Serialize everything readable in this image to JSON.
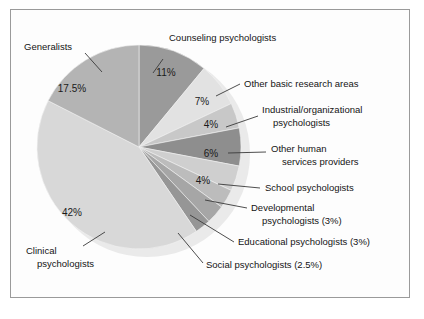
{
  "figure": {
    "border_color": "#9a9a9a",
    "background": "#fdfdfd"
  },
  "chart_data": {
    "type": "pie",
    "title": "",
    "subtitle": "",
    "xlabel": "",
    "ylabel": "",
    "legend_position": "none",
    "grid": false,
    "labels_inside": "percent",
    "start_angle_deg": 0,
    "direction": "clockwise",
    "categories": [
      "Counseling psychologists",
      "Other basic research areas",
      "Industrial/organizational psychologists",
      "Other human services providers",
      "School psychologists",
      "Developmental psychologists",
      "Educational psychologists",
      "Social psychologists",
      "Clinical psychologists",
      "Generalists"
    ],
    "values": [
      11,
      7,
      4,
      6,
      4,
      3,
      3,
      2.5,
      42,
      17.5
    ],
    "value_labels": [
      "11%",
      "7%",
      "4%",
      "6%",
      "4%",
      "3%",
      "3%",
      "2.5%",
      "42%",
      "17.5%"
    ],
    "colors": [
      "#9a9a9a",
      "#e2e2e2",
      "#c8c8c8",
      "#8e8e8e",
      "#cfcfcf",
      "#bcbcbc",
      "#a6a6a6",
      "#969696",
      "#d8d8d8",
      "#b4b4b4"
    ],
    "slices": [
      {
        "name": "Counseling psychologists",
        "value": 11,
        "value_label": "11%",
        "color": "#9a9a9a",
        "inside_label": "11%",
        "inside_x": 166,
        "inside_y": 76,
        "callout_label": "Counseling psychologists",
        "callout_x": 169,
        "callout_y": 41,
        "callout_anchor": "start",
        "leader": "M 163 59 L 153 73"
      },
      {
        "name": "Other basic research areas",
        "value": 7,
        "value_label": "7%",
        "color": "#e2e2e2",
        "inside_label": "7%",
        "inside_x": 202,
        "inside_y": 105,
        "callout_label": "Other basic research areas",
        "callout_x": 244,
        "callout_y": 87,
        "callout_anchor": "start",
        "leader": "M 240 84 L 216 96"
      },
      {
        "name": "Industrial/organizational psychologists",
        "value": 4,
        "value_label": "4%",
        "color": "#c8c8c8",
        "inside_label": "4%",
        "inside_x": 211,
        "inside_y": 128,
        "callout_label_line1": "Industrial/organizational",
        "callout_label_line2": "psychologists",
        "callout_x": 262,
        "callout_y": 113,
        "callout_anchor": "start",
        "leader": "M 258 116 L 226 127"
      },
      {
        "name": "Other human services providers",
        "value": 6,
        "value_label": "6%",
        "color": "#8e8e8e",
        "inside_label": "6%",
        "inside_x": 211,
        "inside_y": 157,
        "callout_label_line1": "Other human",
        "callout_label_line2": "services providers",
        "callout_x": 271,
        "callout_y": 152,
        "callout_anchor": "start",
        "leader": "M 266 152 L 228 153"
      },
      {
        "name": "School psychologists",
        "value": 4,
        "value_label": "4%",
        "color": "#cfcfcf",
        "inside_label": "4%",
        "inside_x": 203,
        "inside_y": 184,
        "callout_label": "School psychologists",
        "callout_x": 265,
        "callout_y": 191,
        "callout_anchor": "start",
        "leader": "M 260 188 L 218 184"
      },
      {
        "name": "Developmental psychologists",
        "value": 3,
        "value_label": "3%",
        "color": "#bcbcbc",
        "inside_label": "",
        "inside_x": 0,
        "inside_y": 0,
        "callout_label_line1": "Developmental",
        "callout_label_line2": "psychologists (3%)",
        "callout_x": 251,
        "callout_y": 211,
        "callout_anchor": "start",
        "leader": "M 247 208 L 205 200"
      },
      {
        "name": "Educational psychologists",
        "value": 3,
        "value_label": "3%",
        "color": "#a6a6a6",
        "inside_label": "",
        "inside_x": 0,
        "inside_y": 0,
        "callout_label": "Educational psychologists (3%)",
        "callout_x": 238,
        "callout_y": 245,
        "callout_anchor": "start",
        "leader": "M 234 242 L 190 215"
      },
      {
        "name": "Social psychologists",
        "value": 2.5,
        "value_label": "2.5%",
        "color": "#969696",
        "inside_label": "",
        "inside_x": 0,
        "inside_y": 0,
        "callout_label": "Social psychologists (2.5%)",
        "callout_x": 206,
        "callout_y": 268,
        "callout_anchor": "start",
        "leader": "M 203 263 L 178 233"
      },
      {
        "name": "Clinical psychologists",
        "value": 42,
        "value_label": "42%",
        "color": "#d8d8d8",
        "inside_label": "42%",
        "inside_x": 72,
        "inside_y": 216,
        "callout_label_line1": "Clinical",
        "callout_label_line2": "psychologists",
        "callout_x": 26,
        "callout_y": 254,
        "callout_anchor": "start",
        "leader": "M 83 246 L 105 232"
      },
      {
        "name": "Generalists",
        "value": 17.5,
        "value_label": "17.5%",
        "color": "#b4b4b4",
        "inside_label": "17.5%",
        "inside_x": 72,
        "inside_y": 92,
        "callout_label": "Generalists",
        "callout_x": 24,
        "callout_y": 50,
        "callout_anchor": "start",
        "leader": "M 85 53 L 102 72"
      }
    ]
  }
}
